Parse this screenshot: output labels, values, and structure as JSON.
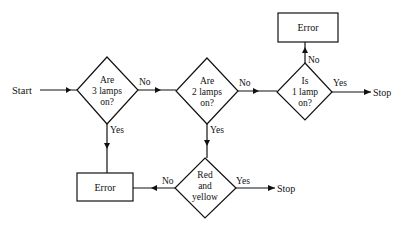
{
  "diagram": {
    "type": "flowchart",
    "start": {
      "label": "Start"
    },
    "decisions": [
      {
        "id": "d1",
        "lines": [
          "Are",
          "3 lamps",
          "on?"
        ],
        "yes_label": "Yes",
        "no_label": "No"
      },
      {
        "id": "d2",
        "lines": [
          "Are",
          "2 lamps",
          "on?"
        ],
        "yes_label": "Yes",
        "no_label": "No"
      },
      {
        "id": "d3",
        "lines": [
          "Is",
          "1 lamp",
          "on?"
        ],
        "yes_label": "Yes",
        "no_label": "No"
      },
      {
        "id": "d4",
        "lines": [
          "Red",
          "and",
          "yellow"
        ],
        "yes_label": "Yes",
        "no_label": "No"
      }
    ],
    "processes": [
      {
        "id": "err_top",
        "label": "Error"
      },
      {
        "id": "err_bottom",
        "label": "Error"
      }
    ],
    "terminals": [
      {
        "id": "stop_right",
        "label": "Stop"
      },
      {
        "id": "stop_bottom",
        "label": "Stop"
      }
    ],
    "edges": [
      {
        "from": "Start",
        "to": "d1",
        "label": ""
      },
      {
        "from": "d1",
        "to": "d2",
        "label": "No"
      },
      {
        "from": "d1",
        "to": "err_bottom",
        "label": "Yes"
      },
      {
        "from": "d2",
        "to": "d3",
        "label": "No"
      },
      {
        "from": "d2",
        "to": "d4",
        "label": "Yes"
      },
      {
        "from": "d3",
        "to": "err_top",
        "label": "No"
      },
      {
        "from": "d3",
        "to": "stop_right",
        "label": "Yes"
      },
      {
        "from": "d4",
        "to": "err_bottom",
        "label": "No"
      },
      {
        "from": "d4",
        "to": "stop_bottom",
        "label": "Yes"
      }
    ]
  }
}
